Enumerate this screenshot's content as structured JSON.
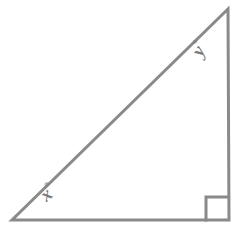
{
  "figure": {
    "kind": "right-triangle-geometry-diagram",
    "background_color": "#ffffff",
    "stroke_color": "#8a8a8a",
    "label_color": "#7a7a7a",
    "stroke_width": 3
  },
  "labels": {
    "angle_x": "x",
    "angle_x_degree_symbol": "°",
    "angle_y": "y",
    "angle_y_degree_symbol": "°"
  },
  "chart_data": {
    "type": "diagram",
    "title": "",
    "shape": "right triangle",
    "vertices": [
      {
        "name": "bottom-left",
        "x": 12,
        "y": 220,
        "angle_label": "x°"
      },
      {
        "name": "top-right",
        "x": 228,
        "y": 9,
        "angle_label": "y°"
      },
      {
        "name": "bottom-right",
        "x": 229,
        "y": 220,
        "angle_label": "90° (right angle mark)"
      }
    ],
    "edges": [
      {
        "name": "base",
        "from": "bottom-left",
        "to": "bottom-right"
      },
      {
        "name": "vertical-leg",
        "from": "bottom-right",
        "to": "top-right"
      },
      {
        "name": "hypotenuse",
        "from": "top-right",
        "to": "bottom-left"
      }
    ],
    "right_angle_marker": {
      "at_vertex": "bottom-right",
      "x": 206,
      "y": 197,
      "size": 22
    },
    "annotations": [
      {
        "text": "x°",
        "x": 58,
        "y": 193,
        "rotation_deg": -41
      },
      {
        "text": "y°",
        "x": 207,
        "y": 50,
        "rotation_deg": -62
      }
    ]
  }
}
